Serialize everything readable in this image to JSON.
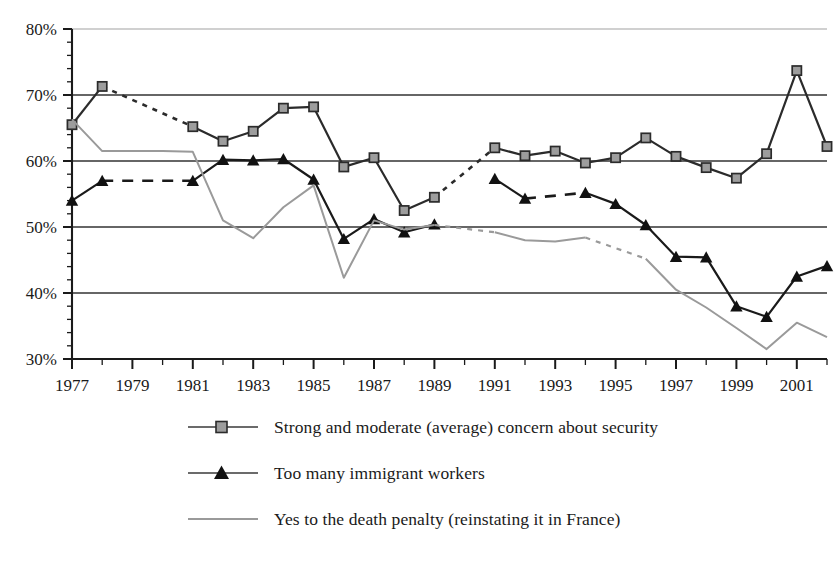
{
  "chart_data": {
    "type": "line",
    "title": "",
    "subtitle": "",
    "xlabel": "",
    "ylabel": "",
    "xlim": [
      1977,
      2002
    ],
    "ylim": [
      30,
      80
    ],
    "grid": true,
    "grid_axis": "y",
    "legend_position": "bottom",
    "x": [
      1977,
      1978,
      1979,
      1980,
      1981,
      1982,
      1983,
      1984,
      1985,
      1986,
      1987,
      1988,
      1989,
      1990,
      1991,
      1992,
      1993,
      1994,
      1995,
      1996,
      1997,
      1998,
      1999,
      2000,
      2001,
      2002
    ],
    "y_ticks": [
      30,
      40,
      50,
      60,
      70,
      80
    ],
    "y_tick_labels": [
      "30%",
      "40%",
      "50%",
      "60%",
      "70%",
      "80%"
    ],
    "x_ticks": [
      1977,
      1979,
      1981,
      1983,
      1985,
      1987,
      1989,
      1991,
      1993,
      1995,
      1997,
      1999,
      2001
    ],
    "x_tick_labels": [
      "1977",
      "1979",
      "1981",
      "1983",
      "1985",
      "1987",
      "1989",
      "1991",
      "1993",
      "1995",
      "1997",
      "1999",
      "2001"
    ],
    "series": [
      {
        "name": "Strong and moderate (average) concern about security",
        "marker": "square",
        "color": "#2b2b2b",
        "values": [
          {
            "x": 1977,
            "y": 65.5
          },
          {
            "x": 1978,
            "y": 71.3
          },
          {
            "x": 1979,
            "y": null
          },
          {
            "x": 1980,
            "y": null
          },
          {
            "x": 1981,
            "y": 65.2
          },
          {
            "x": 1982,
            "y": 63.0
          },
          {
            "x": 1983,
            "y": 64.5
          },
          {
            "x": 1984,
            "y": 68.0
          },
          {
            "x": 1985,
            "y": 68.2
          },
          {
            "x": 1986,
            "y": 59.1
          },
          {
            "x": 1987,
            "y": 60.5
          },
          {
            "x": 1988,
            "y": 52.5
          },
          {
            "x": 1989,
            "y": 54.5
          },
          {
            "x": 1990,
            "y": null
          },
          {
            "x": 1991,
            "y": 62.0
          },
          {
            "x": 1992,
            "y": 60.8
          },
          {
            "x": 1993,
            "y": 61.5
          },
          {
            "x": 1994,
            "y": 59.7
          },
          {
            "x": 1995,
            "y": 60.5
          },
          {
            "x": 1996,
            "y": 63.5
          },
          {
            "x": 1997,
            "y": 60.7
          },
          {
            "x": 1998,
            "y": 59.0
          },
          {
            "x": 1999,
            "y": 57.4
          },
          {
            "x": 2000,
            "y": 61.1
          },
          {
            "x": 2001,
            "y": 73.7
          },
          {
            "x": 2002,
            "y": 62.2
          }
        ],
        "interpolated_gaps": [
          [
            1978,
            1981
          ],
          [
            1989,
            1991
          ]
        ]
      },
      {
        "name": "Too many immigrant workers",
        "marker": "triangle",
        "color": "#1a1a1a",
        "values": [
          {
            "x": 1977,
            "y": 54.0
          },
          {
            "x": 1978,
            "y": 57.0
          },
          {
            "x": 1979,
            "y": null
          },
          {
            "x": 1980,
            "y": null
          },
          {
            "x": 1981,
            "y": 57.0
          },
          {
            "x": 1982,
            "y": 60.2
          },
          {
            "x": 1983,
            "y": 60.1
          },
          {
            "x": 1984,
            "y": 60.3
          },
          {
            "x": 1985,
            "y": 57.2
          },
          {
            "x": 1986,
            "y": 48.2
          },
          {
            "x": 1987,
            "y": 51.2
          },
          {
            "x": 1988,
            "y": 49.2
          },
          {
            "x": 1989,
            "y": 50.4
          },
          {
            "x": 1990,
            "y": null
          },
          {
            "x": 1991,
            "y": 57.3
          },
          {
            "x": 1992,
            "y": 54.3
          },
          {
            "x": 1993,
            "y": null
          },
          {
            "x": 1994,
            "y": 55.2
          },
          {
            "x": 1995,
            "y": 53.5
          },
          {
            "x": 1996,
            "y": 50.3
          },
          {
            "x": 1997,
            "y": 45.5
          },
          {
            "x": 1998,
            "y": 45.4
          },
          {
            "x": 1999,
            "y": 38.0
          },
          {
            "x": 2000,
            "y": 36.4
          },
          {
            "x": 2001,
            "y": 42.5
          },
          {
            "x": 2002,
            "y": 44.1
          }
        ],
        "interpolated_gaps": [
          [
            1978,
            1981
          ],
          [
            1992,
            1994
          ]
        ]
      },
      {
        "name": "Yes to the death penalty (reinstating it in France)",
        "marker": "none",
        "color": "#9a9a9a",
        "values": [
          {
            "x": 1977,
            "y": 66.3
          },
          {
            "x": 1978,
            "y": 61.5
          },
          {
            "x": 1979,
            "y": 61.5
          },
          {
            "x": 1980,
            "y": 61.5
          },
          {
            "x": 1981,
            "y": 61.4
          },
          {
            "x": 1982,
            "y": 51.0
          },
          {
            "x": 1983,
            "y": 48.3
          },
          {
            "x": 1984,
            "y": 53.0
          },
          {
            "x": 1985,
            "y": 56.3
          },
          {
            "x": 1986,
            "y": 42.3
          },
          {
            "x": 1987,
            "y": 51.0
          },
          {
            "x": 1988,
            "y": 49.6
          },
          {
            "x": 1989,
            "y": 50.3
          },
          {
            "x": 1990,
            "y": null
          },
          {
            "x": 1991,
            "y": 49.2
          },
          {
            "x": 1992,
            "y": 48.0
          },
          {
            "x": 1993,
            "y": 47.8
          },
          {
            "x": 1994,
            "y": 48.4
          },
          {
            "x": 1995,
            "y": null
          },
          {
            "x": 1996,
            "y": 45.2
          },
          {
            "x": 1997,
            "y": 40.5
          },
          {
            "x": 1998,
            "y": 37.8
          },
          {
            "x": 1999,
            "y": 34.7
          },
          {
            "x": 2000,
            "y": 31.5
          },
          {
            "x": 2001,
            "y": 35.5
          },
          {
            "x": 2002,
            "y": 33.3
          }
        ],
        "interpolated_gaps": [
          [
            1989,
            1991
          ],
          [
            1994,
            1996
          ]
        ]
      }
    ]
  },
  "legend": {
    "items": [
      {
        "label": "Strong and moderate (average) concern about security",
        "marker": "square"
      },
      {
        "label": "Too many immigrant workers",
        "marker": "triangle"
      },
      {
        "label": "Yes to the death penalty (reinstating it in France)",
        "marker": "none"
      }
    ]
  },
  "colors": {
    "series_security": "#2b2b2b",
    "series_immigrants": "#1a1a1a",
    "series_death_penalty": "#9a9a9a",
    "gridline": "#333333",
    "axis": "#1a1a1a",
    "marker_square_fill": "#9d9d9d",
    "background": "#ffffff"
  }
}
